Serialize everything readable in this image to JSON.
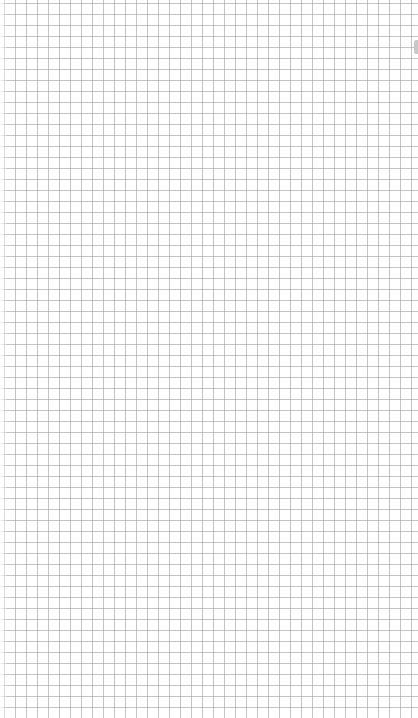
{
  "canvas": {
    "description": "Grid paper",
    "grid": {
      "pitch_px": 11,
      "line_color": "#969696",
      "background_color": "#ffffff",
      "columns": 38,
      "rows": 65
    }
  },
  "scrollbar": {
    "thumb_color": "#c8c8c8"
  }
}
